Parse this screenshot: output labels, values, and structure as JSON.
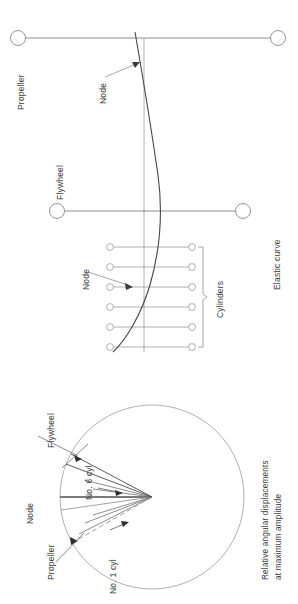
{
  "figure": {
    "title_caption": "Relative angular displacements at maximum amplitude",
    "caption_line1": "Relative  angular  displacements",
    "caption_line2": "at maximum amplitude",
    "orientation": "rotated-90-ccw",
    "background": "#ffffff",
    "line_color": "#555555",
    "curve_color": "#444444",
    "text_color": "#3a3a3a"
  },
  "elastic_curve_diagram": {
    "name": "elastic-curve-diagram",
    "labels": {
      "propeller": "Propeller",
      "flywheel": "Flywheel",
      "elastic_curve": "Elastic curve",
      "cylinders": "Cylinders",
      "node_upper": "Node",
      "node_lower": "Node"
    },
    "masses": [
      {
        "name": "propeller",
        "label": "Propeller",
        "axis_y": 38,
        "x_left": 18,
        "x_right": 278
      },
      {
        "name": "flywheel",
        "label": "Flywheel",
        "axis_y": 211,
        "x_left": 57,
        "x_right": 243
      }
    ],
    "cylinder_count": 6,
    "cylinder_rows_y": [
      247,
      267,
      287,
      307,
      327,
      347
    ],
    "cylinder_x_left": 110,
    "cylinder_x_right": 192,
    "axis_x": 144,
    "node_count": 2,
    "nodes": [
      {
        "label": "Node",
        "at_x": 144,
        "at_y": 63
      },
      {
        "label": "Node",
        "at_x": 144,
        "at_y": 287
      }
    ]
  },
  "angular_displacement_diagram": {
    "name": "angular-displacement-diagram",
    "labels": {
      "node": "Node",
      "propeller": "Propeller",
      "flywheel": "Flywheel",
      "cyl_6": "No. 6 cyl",
      "cyl_1": "No. 1 cyl"
    },
    "circle": {
      "cx": 152,
      "cy": 497,
      "r": 92
    },
    "vectors": [
      {
        "name": "node-reference",
        "label": "Node",
        "angle_deg": 180,
        "length": 92,
        "style": "solid-bold"
      },
      {
        "name": "propeller",
        "label": "Propeller",
        "angle_deg": 188,
        "length": 92,
        "style": "solid"
      },
      {
        "name": "cyl-1",
        "label": "No. 1 cyl",
        "angle_deg": 206,
        "length": 92,
        "style": "solid"
      },
      {
        "name": "cyl-2",
        "angle_deg": 201,
        "length": 72,
        "style": "solid"
      },
      {
        "name": "cyl-3",
        "angle_deg": 197,
        "length": 62,
        "style": "solid"
      },
      {
        "name": "cyl-4",
        "angle_deg": 172,
        "length": 60,
        "style": "solid"
      },
      {
        "name": "cyl-5",
        "angle_deg": 166,
        "length": 70,
        "style": "solid"
      },
      {
        "name": "cyl-6",
        "label": "No. 6 cyl",
        "angle_deg": 159,
        "length": 92,
        "style": "solid"
      },
      {
        "name": "flywheel",
        "label": "Flywheel",
        "angle_deg": 152,
        "length": 92,
        "style": "solid"
      }
    ]
  }
}
